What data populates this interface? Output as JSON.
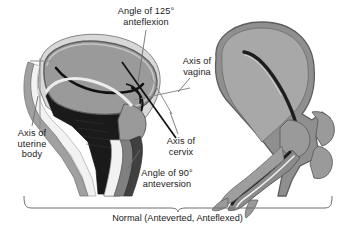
{
  "figure": {
    "type": "medical-illustration",
    "caption": "Normal (Anteverted, Anteflexed)",
    "background_color": "#ffffff",
    "colors": {
      "myometrium": "#9a9a9a",
      "serosa_outline": "#6b6b6b",
      "cavity_line": "#111111",
      "bladder": "#1a1a1a",
      "mucosa_light": "#f2f2f2",
      "mid_band": "#808080",
      "dark_band": "#404040",
      "axis_line_gray": "#8c8c8c",
      "axis_line_black": "#111111",
      "bracket": "#6e6e6e",
      "text": "#1a1a1a"
    },
    "labels": {
      "anteflexion": {
        "line1": "Angle of 125°",
        "line2": "anteflexion",
        "full": "Angle of 125° anteflexion",
        "angle_value": "125°"
      },
      "vagina": {
        "line1": "Axis of",
        "line2": "vagina",
        "full": "Axis of vagina"
      },
      "uterine_body": {
        "line1": "Axis of",
        "line2": "uterine",
        "line3": "body",
        "full": "Axis of uterine body"
      },
      "cervix": {
        "line1": "Axis of",
        "line2": "cervix",
        "full": "Axis of cervix"
      },
      "anteversion": {
        "line1": "Angle of 90°",
        "line2": "anteversion",
        "full": "Angle of 90° anteversion",
        "angle_value": "90°"
      }
    },
    "panels": [
      {
        "name": "left-panel",
        "description": "Uterus in situ with bladder, cervix, vagina and axis lines"
      },
      {
        "name": "right-panel",
        "description": "Isolated uterus with endometrial cavity and vaginal canal"
      }
    ]
  }
}
